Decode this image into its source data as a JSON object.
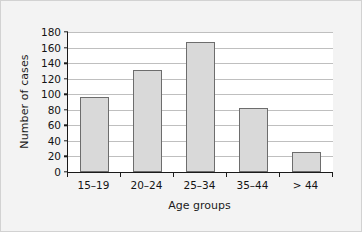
{
  "chart_data": {
    "type": "bar",
    "title": "",
    "xlabel": "Age groups",
    "ylabel": "Number of cases",
    "categories": [
      "15–19",
      "20–24",
      "25–34",
      "35–44",
      "> 44"
    ],
    "values": [
      96,
      131,
      167,
      82,
      26
    ],
    "series": [
      {
        "name": "Number of cases",
        "values": [
          96,
          131,
          167,
          82,
          26
        ]
      }
    ],
    "ylim": [
      0,
      180
    ],
    "ytick_labels": [
      "0",
      "20",
      "40",
      "60",
      "80",
      "100",
      "120",
      "140",
      "160",
      "180"
    ],
    "ytick_values": [
      0,
      20,
      40,
      60,
      80,
      100,
      120,
      140,
      160,
      180
    ],
    "grid": "horizontal",
    "legend": "none",
    "bar_fill_color": "#d9d9d9",
    "bar_border_color": "#6d6d6d",
    "axis_color": "#1a1a1a",
    "gridline_color": "#bfbfbf",
    "plot_background": "#ffffff",
    "figure_background": "#f3f3f3"
  }
}
